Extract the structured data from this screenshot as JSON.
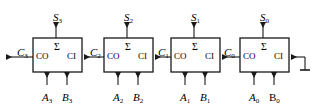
{
  "diagram": {
    "colors": {
      "line": "#1a1a1a",
      "text": "#000000",
      "background": "#ffffff"
    },
    "geometry": {
      "width": 319,
      "height": 107,
      "box_width": 49,
      "box_height": 34,
      "box_top": 38,
      "bus_y": 57,
      "box_lefts": [
        33,
        104,
        171,
        240
      ]
    },
    "stages": [
      {
        "id": "stage-3",
        "box_left": 33,
        "sum_label": {
          "base": "S",
          "sub": "3",
          "x": 53,
          "y": 8
        },
        "carry_out_label": {
          "base": "C",
          "sub": "3",
          "x": 17,
          "y": 44
        },
        "a_label": {
          "base": "A",
          "sub": "3",
          "x": 42,
          "y": 88,
          "upright": false
        },
        "b_label": {
          "base": "B",
          "sub": "3",
          "x": 62,
          "y": 88,
          "upright": false
        },
        "ports": {
          "co": "CO",
          "sum": "Σ",
          "ci": "CI"
        }
      },
      {
        "id": "stage-2",
        "box_left": 104,
        "sum_label": {
          "base": "S",
          "sub": "2",
          "x": 124,
          "y": 8
        },
        "carry_out_label": {
          "base": "C",
          "sub": "2",
          "x": 90,
          "y": 44
        },
        "a_label": {
          "base": "A",
          "sub": "2",
          "x": 113,
          "y": 88,
          "upright": false
        },
        "b_label": {
          "base": "B",
          "sub": "2",
          "x": 133,
          "y": 88,
          "upright": false
        },
        "ports": {
          "co": "CO",
          "sum": "Σ",
          "ci": "CI"
        }
      },
      {
        "id": "stage-1",
        "box_left": 171,
        "sum_label": {
          "base": "S",
          "sub": "1",
          "x": 191,
          "y": 8
        },
        "carry_out_label": {
          "base": "C",
          "sub": "1",
          "x": 158,
          "y": 44
        },
        "a_label": {
          "base": "A",
          "sub": "1",
          "x": 180,
          "y": 88,
          "upright": false
        },
        "b_label": {
          "base": "B",
          "sub": "1",
          "x": 200,
          "y": 88,
          "upright": false
        },
        "ports": {
          "co": "CO",
          "sum": "Σ",
          "ci": "CI"
        }
      },
      {
        "id": "stage-0",
        "box_left": 240,
        "sum_label": {
          "base": "S",
          "sub": "0",
          "x": 260,
          "y": 8
        },
        "carry_out_label": {
          "base": "C",
          "sub": "0",
          "x": 224,
          "y": 44
        },
        "a_label": {
          "base": "A",
          "sub": "0",
          "x": 249,
          "y": 88,
          "upright": false
        },
        "b_label": {
          "base": "B",
          "sub": "0",
          "x": 269,
          "y": 88,
          "upright": true
        },
        "ports": {
          "co": "CO",
          "sum": "Σ",
          "ci": "CI"
        }
      }
    ],
    "ground": {
      "x": 305,
      "top": 57,
      "bottom": 70,
      "bar_half_width": 5
    }
  }
}
